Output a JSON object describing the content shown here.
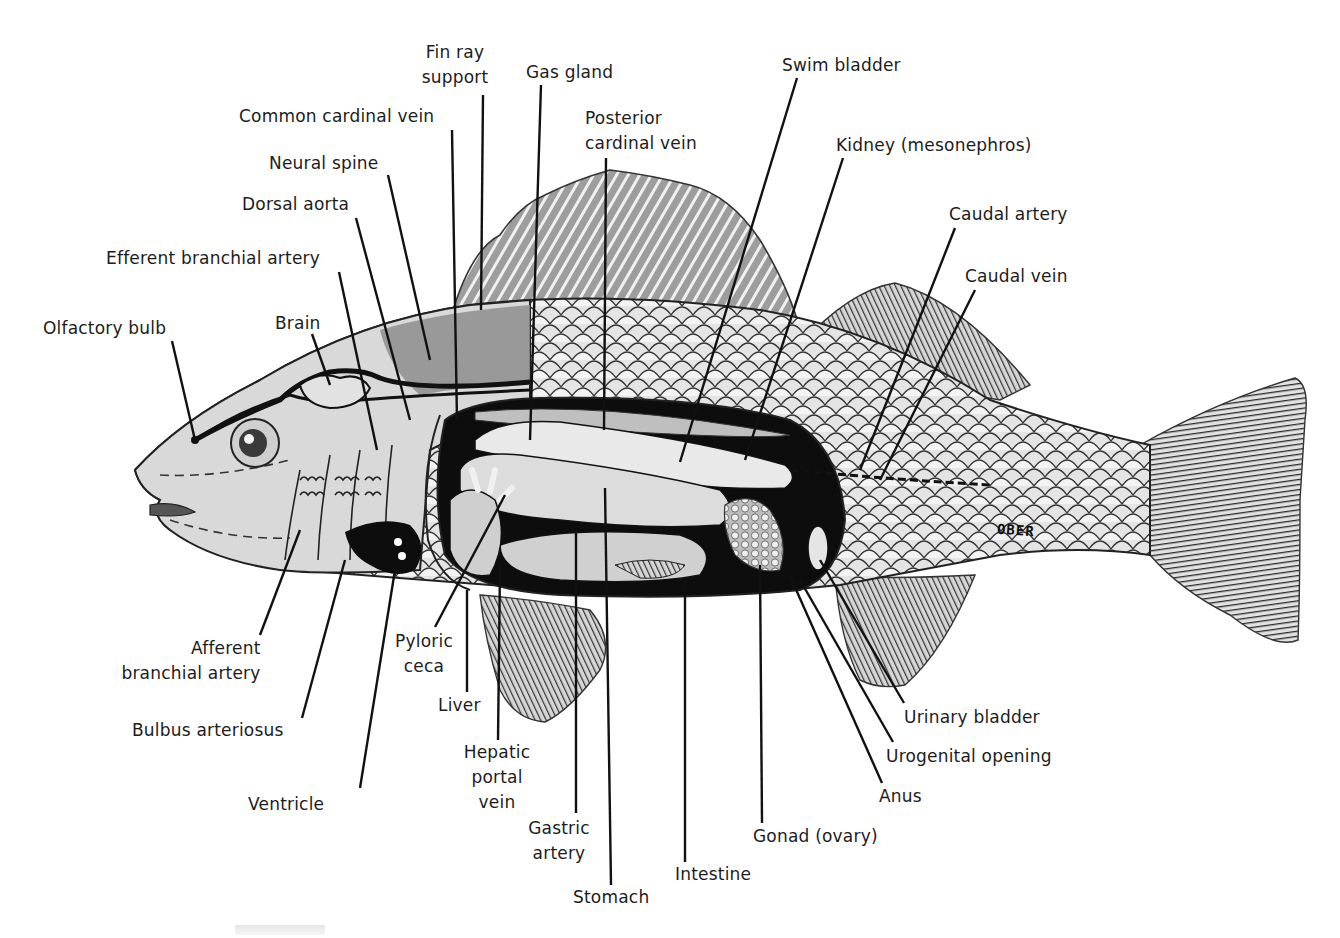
{
  "diagram": {
    "artist_signature": "OBER",
    "colors": {
      "background": "#ffffff",
      "line": "#111111",
      "body_light": "#dcdcdc",
      "body_mid": "#b8b8b8",
      "fin_gray": "#a8a8a8",
      "cavity_black": "#0d0d0d",
      "organ_light": "#e8e8e8"
    }
  },
  "labels": {
    "fin_ray_support": [
      "Fin ray",
      "support"
    ],
    "gas_gland": "Gas gland",
    "swim_bladder": "Swim bladder",
    "common_cardinal_vein": "Common cardinal vein",
    "posterior_cardinal_vein": [
      "Posterior",
      "cardinal vein"
    ],
    "kidney": "Kidney (mesonephros)",
    "neural_spine": "Neural spine",
    "dorsal_aorta": "Dorsal aorta",
    "caudal_artery": "Caudal artery",
    "efferent_branchial_artery": "Efferent branchial artery",
    "caudal_vein": "Caudal vein",
    "olfactory_bulb": "Olfactory bulb",
    "brain": "Brain",
    "afferent_branchial_artery": [
      "Afferent",
      "branchial artery"
    ],
    "pyloric_ceca": [
      "Pyloric",
      "ceca"
    ],
    "liver": "Liver",
    "bulbus_arteriosus": "Bulbus arteriosus",
    "hepatic_portal_vein": [
      "Hepatic",
      "portal",
      "vein"
    ],
    "ventricle": "Ventricle",
    "gastric_artery": [
      "Gastric",
      "artery"
    ],
    "stomach": "Stomach",
    "intestine": "Intestine",
    "gonad": "Gonad (ovary)",
    "anus": "Anus",
    "urogenital_opening": "Urogenital opening",
    "urinary_bladder": "Urinary bladder"
  }
}
